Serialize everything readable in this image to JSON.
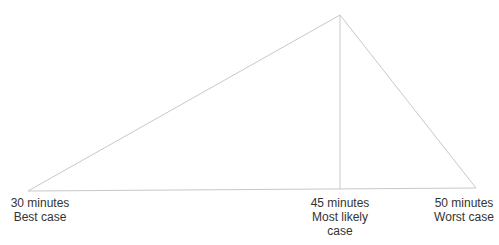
{
  "diagram": {
    "type": "triangular-estimate",
    "line_color": "#c8c8c8",
    "points": [
      {
        "id": "best",
        "time": "30 minutes",
        "case_lines": [
          "Best case"
        ]
      },
      {
        "id": "likely",
        "time": "45 minutes",
        "case_lines": [
          "Most likely",
          "case"
        ]
      },
      {
        "id": "worst",
        "time": "50 minutes",
        "case_lines": [
          "Worst case"
        ]
      }
    ]
  }
}
